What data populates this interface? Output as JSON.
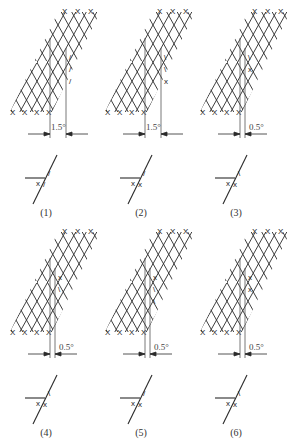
{
  "figure": {
    "caption": "",
    "panels": [
      {
        "id": 1,
        "label": "(1)",
        "dimension": "1.5°",
        "ox": 0,
        "oy": 0,
        "gap": 16,
        "lattice_marks": [
          "/",
          "/",
          "/"
        ],
        "symbol_marks": [
          "x",
          "/",
          "/"
        ]
      },
      {
        "id": 2,
        "label": "(2)",
        "dimension": "1.5°",
        "ox": 95,
        "oy": 0,
        "gap": 16,
        "lattice_marks": [
          "\\",
          "\\",
          "x"
        ],
        "symbol_marks": [
          "x",
          "x",
          "/"
        ]
      },
      {
        "id": 3,
        "label": "(3)",
        "dimension": "0.5°",
        "ox": 190,
        "oy": 0,
        "gap": 5,
        "lattice_marks": [
          "\\",
          "x"
        ],
        "symbol_marks": [
          "x",
          "x",
          "\\"
        ]
      },
      {
        "id": 4,
        "label": "(4)",
        "dimension": "0.5°",
        "ox": 0,
        "oy": 220,
        "gap": 5,
        "lattice_marks": [
          "x",
          "\\"
        ],
        "symbol_marks": [
          "x",
          "x",
          "\\"
        ]
      },
      {
        "id": 5,
        "label": "(5)",
        "dimension": "0.5°",
        "ox": 95,
        "oy": 220,
        "gap": 5,
        "lattice_marks": [
          "x",
          "\\",
          "\\"
        ],
        "symbol_marks": [
          "x",
          "x",
          "/"
        ]
      },
      {
        "id": 6,
        "label": "(6)",
        "dimension": "0.5°",
        "ox": 190,
        "oy": 220,
        "gap": 5,
        "lattice_marks": [
          "x",
          "x"
        ],
        "symbol_marks": [
          "x",
          "x",
          "\\"
        ]
      }
    ]
  },
  "colors": {
    "line": "#2a2a2a",
    "ref_line": "#555555",
    "background": "#ffffff"
  }
}
